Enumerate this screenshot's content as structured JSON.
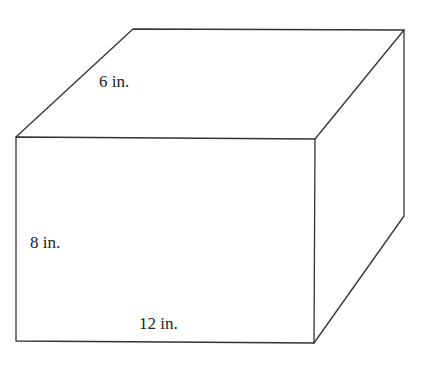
{
  "figure": {
    "type": "rectangular-prism",
    "line_color": "#333333",
    "background": "#ffffff",
    "vertices": {
      "front_top_left": [
        16,
        137
      ],
      "front_top_right": [
        315,
        139
      ],
      "front_bottom_right": [
        314,
        343
      ],
      "front_bottom_left": [
        16,
        341
      ],
      "back_top_left": [
        133,
        29
      ],
      "back_top_right": [
        404,
        30
      ],
      "back_bottom_right": [
        404,
        216
      ]
    },
    "labels": {
      "depth": "6 in.",
      "height": "8 in.",
      "length": "12 in."
    }
  }
}
